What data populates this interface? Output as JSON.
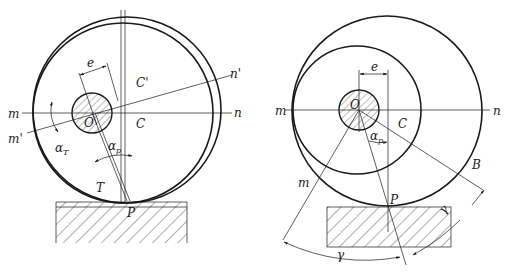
{
  "figure": {
    "left_panel": {
      "name": "eccentric-wheel-tilted",
      "labels": {
        "m": "m",
        "n": "n",
        "m_prime": "m'",
        "n_prime": "n'",
        "O": "O",
        "C": "C",
        "C_prime": "C'",
        "e": "e",
        "alpha_T": "α",
        "alpha_T_sub": "T",
        "alpha_p": "α",
        "alpha_p_sub": "p",
        "T": "T",
        "P": "P"
      }
    },
    "right_panel": {
      "name": "eccentric-wheel-offset",
      "labels": {
        "m": "m",
        "n": "n",
        "m_lower": "m",
        "O": "O",
        "C": "C",
        "e": "e",
        "alpha_p": "α",
        "alpha_p_sub": "p",
        "B": "B",
        "P": "P",
        "gamma": "γ",
        "gamma_small": "γ"
      }
    },
    "colors": {
      "line": "#1a1a1a",
      "background": "#ffffff"
    }
  }
}
